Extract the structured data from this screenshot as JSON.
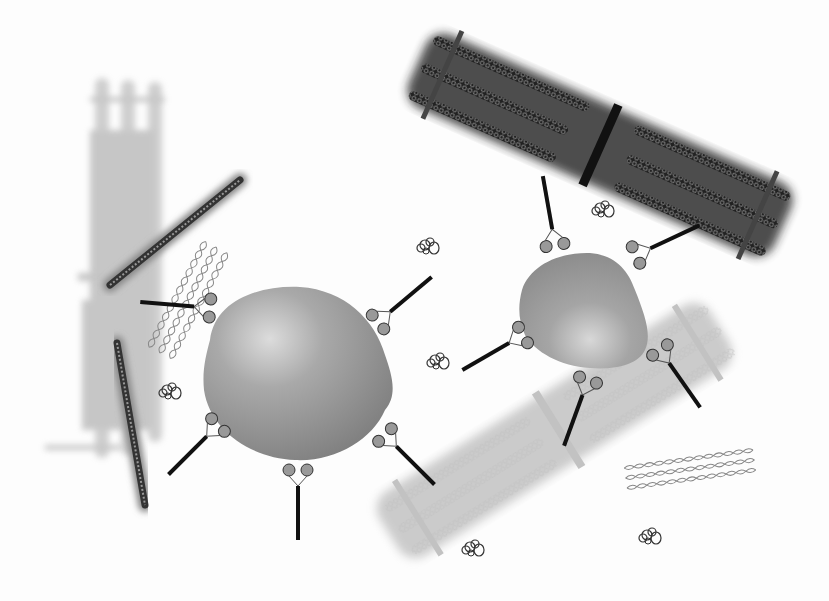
{
  "canvas": {
    "width": 829,
    "height": 601,
    "background": "#fdfdfd"
  },
  "colors": {
    "faded_filament": "#b8b8b8",
    "faded_filament_dark": "#a6a6a6",
    "dark_filament": "#1a1a1a",
    "actin_dark": "#3a3a3a",
    "vesicle_light": "#c9c9c9",
    "vesicle_mid": "#9c9c9c",
    "vesicle_dark": "#7a7a7a",
    "rod": "#111111",
    "coil": "#444444",
    "mesh": "#777777"
  },
  "elements": {
    "sarcomere_faded_left": {
      "label": "faded-sarcomere-vertical"
    },
    "sarcomere_dark_top": {
      "label": "dark-sarcomere-diagonal"
    },
    "sarcomere_faded_bottom": {
      "label": "faded-sarcomere-diagonal"
    },
    "actin_filaments": [
      {
        "x1": 110,
        "y1": 285,
        "x2": 240,
        "y2": 180
      },
      {
        "x1": 117,
        "y1": 343,
        "x2": 145,
        "y2": 505
      }
    ],
    "vesicles": [
      {
        "id": "large",
        "cx": 297,
        "cy": 370,
        "rx": 93,
        "ry": 85
      },
      {
        "id": "small",
        "cx": 583,
        "cy": 313,
        "rx": 65,
        "ry": 58
      }
    ],
    "free_proteins": [
      {
        "x": 428,
        "y": 248
      },
      {
        "x": 603,
        "y": 210
      },
      {
        "x": 170,
        "y": 393
      },
      {
        "x": 438,
        "y": 362
      },
      {
        "x": 473,
        "y": 548
      },
      {
        "x": 650,
        "y": 535
      }
    ],
    "meshes": [
      {
        "x": 185,
        "y": 300,
        "angle": -55
      },
      {
        "x": 683,
        "y": 468,
        "angle": -10
      }
    ]
  }
}
